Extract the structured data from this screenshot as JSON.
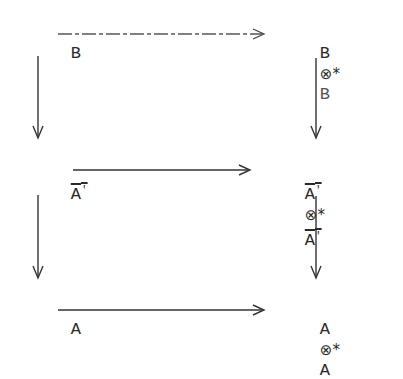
{
  "diagram": {
    "type": "commutative-square",
    "rows": [
      {
        "left": "B",
        "right_a": "B",
        "op": "⊗*",
        "right_b": "B",
        "overline": false
      },
      {
        "left": "A",
        "left_prime": "'",
        "right_a": "A",
        "right_a_prime": "'",
        "op": "⊗*",
        "right_b": "A",
        "right_b_prime": "'",
        "overline": true
      },
      {
        "left": "A",
        "right_a": "A",
        "op": "⊗*",
        "right_b": "A",
        "overline": false
      }
    ],
    "arrows": [
      {
        "from": "B",
        "to": "B ⊗* B",
        "direction": "right",
        "style": "dashed-faint"
      },
      {
        "from": "A'",
        "to": "A' ⊗* A'",
        "direction": "right",
        "style": "solid"
      },
      {
        "from": "A",
        "to": "A ⊗* A",
        "direction": "right",
        "style": "solid"
      },
      {
        "from": "B",
        "to": "A'",
        "direction": "down"
      },
      {
        "from": "A'",
        "to": "A",
        "direction": "down"
      },
      {
        "from": "B ⊗* B",
        "to": "A' ⊗* A'",
        "direction": "down"
      },
      {
        "from": "A' ⊗* A'",
        "to": "A ⊗* A",
        "direction": "down"
      }
    ],
    "ink_color": "#2a2a2a"
  }
}
